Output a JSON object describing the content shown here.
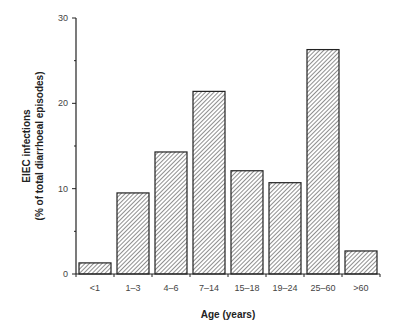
{
  "chart_data": {
    "type": "bar",
    "title": "",
    "xlabel": "Age (years)",
    "ylabel": "EIEC infections",
    "ylabel_sub": "(% of total diarrhoeal episodes)",
    "categories": [
      "<1",
      "1–3",
      "4–6",
      "7–14",
      "15–18",
      "19–24",
      "25–60",
      ">60"
    ],
    "values": [
      1.3,
      9.5,
      14.3,
      21.4,
      12.1,
      10.7,
      26.3,
      2.7
    ],
    "ylim": [
      0,
      30
    ],
    "yticks": [
      0,
      10,
      20,
      30
    ],
    "yminor_ticks": [
      5,
      15,
      25
    ],
    "grid": false,
    "legend": null,
    "bar_fill": "diagonal-hatch",
    "colors": {
      "bar_stroke": "#222222",
      "hatch": "#444444",
      "axis": "#222222"
    }
  },
  "labels": {
    "xlabel": "Age (years)",
    "ylabel_line1": "EIEC infections",
    "ylabel_line2": "(% of total diarrhoeal episodes)"
  }
}
